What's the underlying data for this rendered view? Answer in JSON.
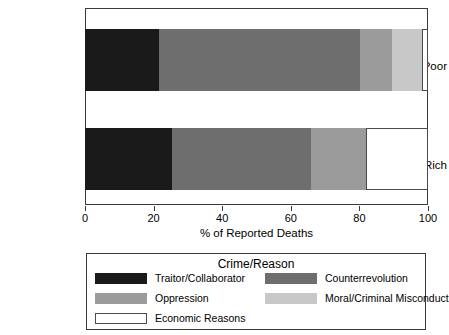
{
  "chart_data": {
    "type": "bar",
    "orientation": "horizontal",
    "stacked": true,
    "title": "",
    "xlabel": "% of Reported Deaths",
    "ylabel": "",
    "xlim": [
      0,
      100
    ],
    "xticks": [
      0,
      20,
      40,
      60,
      80,
      100
    ],
    "xtick_labels": [
      "0",
      "20",
      "40",
      "60",
      "80",
      "100"
    ],
    "grid": false,
    "legend_position": "below-plot",
    "legend_title": "Crime/Reason",
    "categories": [
      "Middle/Poor",
      "Landlord/Rich"
    ],
    "series": [
      {
        "name": "Traitor/Collaborator",
        "color": "#1a1a1a",
        "values": [
          21.6,
          25.4
        ]
      },
      {
        "name": "Counterrevolution",
        "color": "#6e6e6e",
        "values": [
          58.5,
          40.4
        ]
      },
      {
        "name": "Oppression",
        "color": "#9b9b9b",
        "values": [
          9.4,
          16.1
        ]
      },
      {
        "name": "Moral/Criminal Misconduct",
        "color": "#c8c8c8",
        "values": [
          8.8,
          0.0
        ]
      },
      {
        "name": "Economic Reasons",
        "color": "#ffffff",
        "values": [
          1.7,
          18.1
        ]
      }
    ],
    "annotations": []
  },
  "axis": {
    "x_title": "% of Reported Deaths",
    "tick_labels": [
      "0",
      "20",
      "40",
      "60",
      "80",
      "100"
    ],
    "category_labels": [
      "Middle/Poor",
      "Landlord/Rich"
    ]
  },
  "legend": {
    "title": "Crime/Reason",
    "items": [
      {
        "label": "Traitor/Collaborator",
        "color": "#1a1a1a",
        "outlined": false
      },
      {
        "label": "Oppression",
        "color": "#9b9b9b",
        "outlined": false
      },
      {
        "label": "Economic Reasons",
        "color": "#ffffff",
        "outlined": true
      },
      {
        "label": "Counterrevolution",
        "color": "#6e6e6e",
        "outlined": false
      },
      {
        "label": "Moral/Criminal Misconduct",
        "color": "#c8c8c8",
        "outlined": false
      }
    ]
  }
}
